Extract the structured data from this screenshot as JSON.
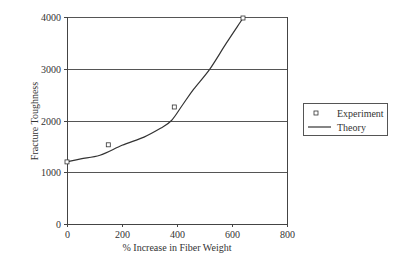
{
  "chart_data": {
    "type": "line",
    "title": "",
    "xlabel": "% Increase in Fiber Weight",
    "ylabel": "Fracture Toughness",
    "xlim": [
      0,
      800
    ],
    "ylim": [
      0,
      4000
    ],
    "x_ticks": [
      0,
      200,
      400,
      600,
      800
    ],
    "y_ticks": [
      0,
      1000,
      2000,
      3000,
      4000
    ],
    "x_tick_labels": [
      "0",
      "200",
      "400",
      "600",
      "800"
    ],
    "y_tick_labels": [
      "0",
      "1000",
      "2000",
      "3000",
      "4000"
    ],
    "grid": "horizontal",
    "legend_position": "right",
    "series": [
      {
        "name": "Experiment",
        "kind": "scatter",
        "marker": "square-hollow",
        "x": [
          0,
          150,
          390,
          640
        ],
        "y": [
          1200,
          1530,
          2260,
          3980
        ]
      },
      {
        "name": "Theory",
        "kind": "line",
        "x": [
          0,
          50,
          120,
          200,
          280,
          340,
          380,
          420,
          460,
          520,
          580,
          640
        ],
        "y": [
          1200,
          1260,
          1330,
          1520,
          1680,
          1850,
          2000,
          2300,
          2600,
          3000,
          3500,
          3980
        ]
      }
    ]
  },
  "legend": {
    "items": [
      {
        "label": "Experiment",
        "symbol": "square-marker"
      },
      {
        "label": "Theory",
        "symbol": "line"
      }
    ]
  },
  "colors": {
    "line": "#333333",
    "grid": "#555555",
    "axis": "#444444",
    "marker_stroke": "#333333"
  }
}
